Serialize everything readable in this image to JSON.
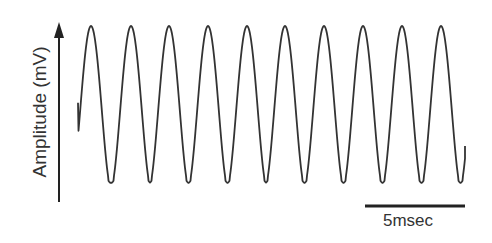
{
  "chart_data": {
    "type": "line",
    "title": "",
    "xlabel": "",
    "ylabel": "Amplitude (mV)",
    "grid": false,
    "legend": null,
    "y_axis": {
      "arrow": true,
      "ticks": []
    },
    "x_axis": {
      "shown": false
    },
    "scale_bar": {
      "label": "5msec",
      "duration_ms": 5
    },
    "period_ms": 1.95,
    "frequency_hz_approx": 513,
    "peaks_count": 10,
    "peak_times_ms": [
      1.0,
      3.0,
      4.9,
      6.85,
      8.8,
      10.7,
      12.65,
      14.6,
      16.55,
      18.5
    ],
    "normalized_amplitude": {
      "min": 0,
      "max": 1,
      "start_value": 0.52,
      "end_value": 0.25
    },
    "series": [
      {
        "name": "signal",
        "color": "#333333"
      }
    ]
  },
  "labels": {
    "ylabel": "Amplitude (mV)",
    "scale_bar": "5msec"
  },
  "colors": {
    "trace": "#333333",
    "axis": "#222222",
    "text": "#333333",
    "background": "#ffffff"
  }
}
